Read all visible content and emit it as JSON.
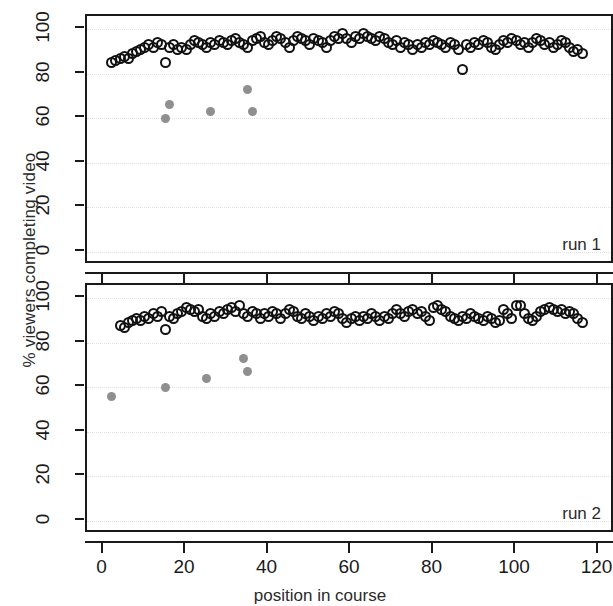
{
  "chart_data": {
    "type": "scatter",
    "title": "",
    "xlabel": "position in course",
    "ylabel": "% viewers completing video",
    "xlim": [
      -4,
      124
    ],
    "ylim": [
      -6,
      106
    ],
    "xticks": [
      0,
      20,
      40,
      60,
      80,
      100,
      120
    ],
    "yticks": [
      0,
      20,
      40,
      60,
      80,
      100
    ],
    "grid": "dotted-light",
    "legend": "none",
    "panels": [
      {
        "label": "run 1",
        "series": [
          {
            "name": "completed-video-open",
            "marker": "open-circle",
            "color": "#111111",
            "points": [
              [
                2,
                85
              ],
              [
                3,
                86
              ],
              [
                4,
                87
              ],
              [
                5,
                88
              ],
              [
                6,
                87
              ],
              [
                7,
                89
              ],
              [
                8,
                90
              ],
              [
                9,
                91
              ],
              [
                10,
                92
              ],
              [
                11,
                93
              ],
              [
                12,
                92
              ],
              [
                13,
                94
              ],
              [
                14,
                93
              ],
              [
                15,
                85
              ],
              [
                16,
                92
              ],
              [
                17,
                93
              ],
              [
                18,
                91
              ],
              [
                19,
                92
              ],
              [
                20,
                91
              ],
              [
                21,
                93
              ],
              [
                22,
                95
              ],
              [
                23,
                94
              ],
              [
                24,
                93
              ],
              [
                25,
                92
              ],
              [
                26,
                94
              ],
              [
                27,
                93
              ],
              [
                28,
                95
              ],
              [
                29,
                94
              ],
              [
                30,
                93
              ],
              [
                31,
                95
              ],
              [
                32,
                96
              ],
              [
                33,
                94
              ],
              [
                34,
                93
              ],
              [
                35,
                92
              ],
              [
                36,
                95
              ],
              [
                37,
                96
              ],
              [
                38,
                97
              ],
              [
                39,
                94
              ],
              [
                40,
                93
              ],
              [
                41,
                95
              ],
              [
                42,
                97
              ],
              [
                43,
                96
              ],
              [
                44,
                94
              ],
              [
                45,
                92
              ],
              [
                46,
                95
              ],
              [
                47,
                97
              ],
              [
                48,
                96
              ],
              [
                49,
                95
              ],
              [
                50,
                93
              ],
              [
                51,
                96
              ],
              [
                52,
                95
              ],
              [
                53,
                94
              ],
              [
                54,
                92
              ],
              [
                55,
                95
              ],
              [
                56,
                97
              ],
              [
                57,
                96
              ],
              [
                58,
                98
              ],
              [
                59,
                96
              ],
              [
                60,
                94
              ],
              [
                61,
                97
              ],
              [
                62,
                96
              ],
              [
                63,
                98
              ],
              [
                64,
                97
              ],
              [
                65,
                96
              ],
              [
                66,
                95
              ],
              [
                67,
                97
              ],
              [
                68,
                96
              ],
              [
                69,
                94
              ],
              [
                70,
                93
              ],
              [
                71,
                95
              ],
              [
                72,
                92
              ],
              [
                73,
                94
              ],
              [
                74,
                93
              ],
              [
                75,
                91
              ],
              [
                76,
                93
              ],
              [
                77,
                92
              ],
              [
                78,
                94
              ],
              [
                79,
                93
              ],
              [
                80,
                95
              ],
              [
                81,
                94
              ],
              [
                82,
                93
              ],
              [
                83,
                92
              ],
              [
                84,
                94
              ],
              [
                85,
                93
              ],
              [
                86,
                91
              ],
              [
                87,
                82
              ],
              [
                88,
                93
              ],
              [
                89,
                92
              ],
              [
                90,
                94
              ],
              [
                91,
                93
              ],
              [
                92,
                95
              ],
              [
                93,
                94
              ],
              [
                94,
                92
              ],
              [
                95,
                91
              ],
              [
                96,
                93
              ],
              [
                97,
                95
              ],
              [
                98,
                94
              ],
              [
                99,
                96
              ],
              [
                100,
                95
              ],
              [
                101,
                93
              ],
              [
                102,
                94
              ],
              [
                103,
                92
              ],
              [
                104,
                94
              ],
              [
                105,
                96
              ],
              [
                106,
                95
              ],
              [
                107,
                93
              ],
              [
                108,
                94
              ],
              [
                109,
                92
              ],
              [
                110,
                93
              ],
              [
                111,
                95
              ],
              [
                112,
                94
              ],
              [
                113,
                92
              ],
              [
                114,
                90
              ],
              [
                115,
                91
              ],
              [
                116,
                89
              ]
            ]
          },
          {
            "name": "completed-video-highlight",
            "marker": "filled-circle",
            "color": "#8f8f8f",
            "points": [
              [
                15,
                60
              ],
              [
                16,
                66
              ],
              [
                26,
                63
              ],
              [
                35,
                73
              ],
              [
                36,
                63
              ]
            ]
          }
        ]
      },
      {
        "label": "run 2",
        "series": [
          {
            "name": "completed-video-open",
            "marker": "open-circle",
            "color": "#111111",
            "points": [
              [
                4,
                88
              ],
              [
                5,
                87
              ],
              [
                6,
                89
              ],
              [
                7,
                90
              ],
              [
                8,
                91
              ],
              [
                9,
                90
              ],
              [
                10,
                92
              ],
              [
                11,
                91
              ],
              [
                12,
                93
              ],
              [
                13,
                92
              ],
              [
                14,
                94
              ],
              [
                15,
                86
              ],
              [
                16,
                92
              ],
              [
                17,
                91
              ],
              [
                18,
                93
              ],
              [
                19,
                94
              ],
              [
                20,
                96
              ],
              [
                21,
                95
              ],
              [
                22,
                94
              ],
              [
                23,
                95
              ],
              [
                24,
                92
              ],
              [
                25,
                91
              ],
              [
                26,
                93
              ],
              [
                27,
                92
              ],
              [
                28,
                94
              ],
              [
                29,
                93
              ],
              [
                30,
                95
              ],
              [
                31,
                96
              ],
              [
                32,
                94
              ],
              [
                33,
                97
              ],
              [
                34,
                93
              ],
              [
                35,
                92
              ],
              [
                36,
                94
              ],
              [
                37,
                93
              ],
              [
                38,
                91
              ],
              [
                39,
                93
              ],
              [
                40,
                92
              ],
              [
                41,
                94
              ],
              [
                42,
                93
              ],
              [
                43,
                91
              ],
              [
                44,
                93
              ],
              [
                45,
                95
              ],
              [
                46,
                94
              ],
              [
                47,
                92
              ],
              [
                48,
                91
              ],
              [
                49,
                93
              ],
              [
                50,
                92
              ],
              [
                51,
                90
              ],
              [
                52,
                92
              ],
              [
                53,
                91
              ],
              [
                54,
                93
              ],
              [
                55,
                92
              ],
              [
                56,
                94
              ],
              [
                57,
                93
              ],
              [
                58,
                91
              ],
              [
                59,
                89
              ],
              [
                60,
                91
              ],
              [
                61,
                92
              ],
              [
                62,
                90
              ],
              [
                63,
                92
              ],
              [
                64,
                91
              ],
              [
                65,
                93
              ],
              [
                66,
                92
              ],
              [
                67,
                90
              ],
              [
                68,
                92
              ],
              [
                69,
                91
              ],
              [
                70,
                93
              ],
              [
                71,
                95
              ],
              [
                72,
                93
              ],
              [
                73,
                92
              ],
              [
                74,
                94
              ],
              [
                75,
                95
              ],
              [
                76,
                93
              ],
              [
                77,
                94
              ],
              [
                78,
                92
              ],
              [
                79,
                90
              ],
              [
                80,
                96
              ],
              [
                81,
                97
              ],
              [
                82,
                95
              ],
              [
                83,
                94
              ],
              [
                84,
                92
              ],
              [
                85,
                91
              ],
              [
                86,
                90
              ],
              [
                87,
                92
              ],
              [
                88,
                91
              ],
              [
                89,
                93
              ],
              [
                90,
                92
              ],
              [
                91,
                91
              ],
              [
                92,
                90
              ],
              [
                93,
                92
              ],
              [
                94,
                91
              ],
              [
                95,
                89
              ],
              [
                96,
                90
              ],
              [
                97,
                95
              ],
              [
                98,
                93
              ],
              [
                99,
                91
              ],
              [
                100,
                97
              ],
              [
                101,
                97
              ],
              [
                102,
                93
              ],
              [
                103,
                91
              ],
              [
                104,
                90
              ],
              [
                105,
                92
              ],
              [
                106,
                94
              ],
              [
                107,
                95
              ],
              [
                108,
                96
              ],
              [
                109,
                95
              ],
              [
                110,
                94
              ],
              [
                111,
                95
              ],
              [
                112,
                93
              ],
              [
                113,
                94
              ],
              [
                114,
                93
              ],
              [
                115,
                91
              ],
              [
                116,
                89
              ]
            ]
          },
          {
            "name": "completed-video-highlight",
            "marker": "filled-circle",
            "color": "#8f8f8f",
            "points": [
              [
                2,
                56
              ],
              [
                15,
                60
              ],
              [
                25,
                64
              ],
              [
                34,
                73
              ],
              [
                35,
                67
              ]
            ]
          }
        ]
      }
    ]
  },
  "axes": {
    "y_title": "% viewers completing video",
    "x_title": "position in course",
    "y_tick_labels": [
      "0",
      "20",
      "40",
      "60",
      "80",
      "100"
    ],
    "x_tick_labels": [
      "0",
      "20",
      "40",
      "60",
      "80",
      "100",
      "120"
    ]
  },
  "panels": {
    "run1_label": "run 1",
    "run2_label": "run 2"
  },
  "colors": {
    "open_marker": "#111111",
    "filled_marker": "#8f8f8f",
    "frame": "#1a1a1a",
    "grid": "#e2e2e2",
    "background": "#ffffff"
  }
}
